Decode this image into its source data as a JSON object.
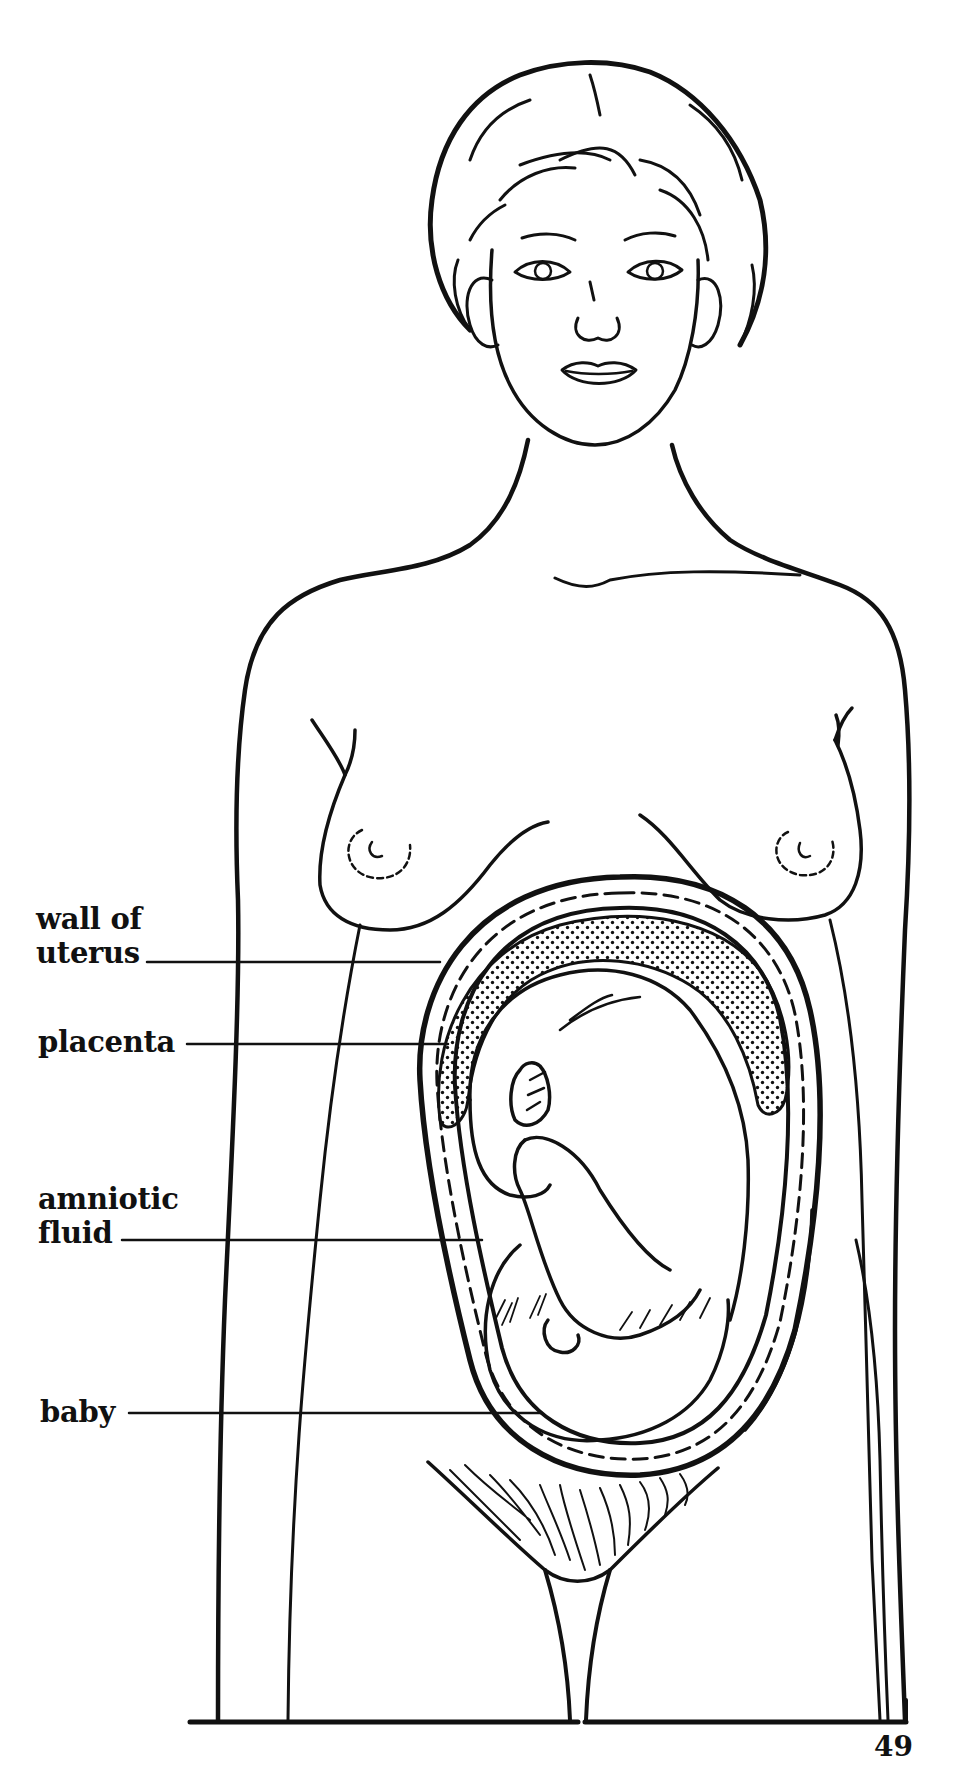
{
  "figure": {
    "colors": {
      "ink": "#111111",
      "paper": "#ffffff"
    }
  },
  "labels": [
    {
      "id": "wall-of-uterus",
      "line1": "wall of",
      "line2": "uterus"
    },
    {
      "id": "placenta",
      "line1": "placenta"
    },
    {
      "id": "amniotic-fluid",
      "line1": "amniotic",
      "line2": "fluid"
    },
    {
      "id": "baby",
      "line1": "baby"
    }
  ],
  "page": {
    "number": "49"
  }
}
